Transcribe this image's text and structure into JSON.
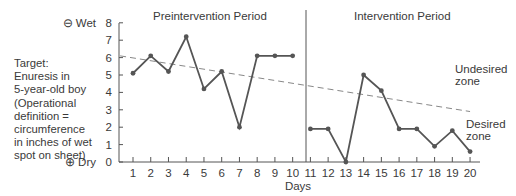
{
  "chart_data": {
    "type": "line",
    "title": "",
    "phases": [
      {
        "label": "Preintervention Period",
        "days": [
          1,
          10
        ]
      },
      {
        "label": "Intervention Period",
        "days": [
          11,
          20
        ]
      }
    ],
    "xlabel": "Days",
    "ylabel": "Target: Enuresis in 5-year-old boy (Operational definition = circumference in inches of wet spot on sheet)",
    "x": [
      1,
      2,
      3,
      4,
      5,
      6,
      7,
      8,
      9,
      10,
      11,
      12,
      13,
      14,
      15,
      16,
      17,
      18,
      19,
      20
    ],
    "series": [
      {
        "name": "Wet spot circumference (inches)",
        "values": [
          5.1,
          6.1,
          5.2,
          7.2,
          4.2,
          5.2,
          2.0,
          6.1,
          6.1,
          6.1,
          1.9,
          1.9,
          0.0,
          5.0,
          4.1,
          1.9,
          1.9,
          0.9,
          1.8,
          0.6
        ]
      }
    ],
    "trend_line": {
      "style": "dashed",
      "start": {
        "x": 0.5,
        "y": 6.1
      },
      "end": {
        "x": 20,
        "y": 2.9
      }
    },
    "phase_change_line_after_day": 10,
    "ylim": [
      0,
      8
    ],
    "yticks": [
      0,
      1,
      2,
      3,
      4,
      5,
      6,
      7,
      8
    ],
    "ytick_end_labels": {
      "top": "Wet",
      "top_symbol": "⊖",
      "bottom": "Dry",
      "bottom_symbol": "⊕"
    },
    "annotations": [
      "Undesired zone",
      "Desired zone"
    ],
    "grid": false,
    "legend": "none"
  },
  "labels": {
    "pre_period": "Preintervention Period",
    "int_period": "Intervention Period",
    "days": "Days",
    "wet": "⊖ Wet",
    "dry": "⊕ Dry",
    "undesired_1": "Undesired",
    "undesired_2": "zone",
    "desired_1": "Desired",
    "desired_2": "zone",
    "target_lines": [
      "Target:",
      "Enuresis in",
      "5-year-old boy",
      "(Operational",
      "definition =",
      "circumference",
      "in inches of wet",
      "spot on sheet)"
    ]
  }
}
